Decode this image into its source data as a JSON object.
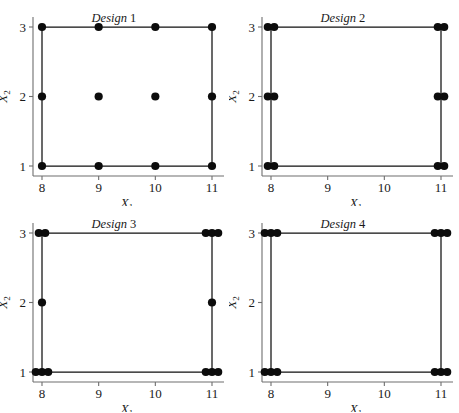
{
  "figure": {
    "panel_order": [
      "design1",
      "design2",
      "design3",
      "design4"
    ]
  },
  "axes": {
    "x_label_main": "X",
    "x_label_sub": "1",
    "y_label_main": "X",
    "y_label_sub": "2",
    "x_ticks": [
      "8",
      "9",
      "10",
      "11"
    ],
    "y_ticks": [
      "1",
      "2",
      "3"
    ],
    "x_tick_values": [
      8,
      9,
      10,
      11
    ],
    "y_tick_values": [
      1,
      2,
      3
    ],
    "xlim": [
      8,
      11
    ],
    "ylim": [
      1,
      3
    ],
    "grid": false
  },
  "style": {
    "marker_color": "#0c0c0c",
    "line_color": "#111111",
    "spine_color": "#6e6e6e",
    "background": "#ffffff",
    "marker_radius": 4.1
  },
  "chart_data": [
    {
      "type": "scatter",
      "id": "design1",
      "title_italic": "Design",
      "title_number": "1",
      "xlabel": "X1",
      "ylabel": "X2",
      "xlim": [
        8,
        11
      ],
      "ylim": [
        1,
        3
      ],
      "grid": false,
      "connecting_rect": [
        [
          8,
          1
        ],
        [
          11,
          1
        ],
        [
          11,
          3
        ],
        [
          8,
          3
        ]
      ],
      "points": [
        {
          "x": 8,
          "y": 3,
          "n": 1
        },
        {
          "x": 9,
          "y": 3,
          "n": 1
        },
        {
          "x": 10,
          "y": 3,
          "n": 1
        },
        {
          "x": 11,
          "y": 3,
          "n": 1
        },
        {
          "x": 8,
          "y": 2,
          "n": 1
        },
        {
          "x": 9,
          "y": 2,
          "n": 1
        },
        {
          "x": 10,
          "y": 2,
          "n": 1
        },
        {
          "x": 11,
          "y": 2,
          "n": 1
        },
        {
          "x": 8,
          "y": 1,
          "n": 1
        },
        {
          "x": 9,
          "y": 1,
          "n": 1
        },
        {
          "x": 10,
          "y": 1,
          "n": 1
        },
        {
          "x": 11,
          "y": 1,
          "n": 1
        }
      ]
    },
    {
      "type": "scatter",
      "id": "design2",
      "title_italic": "Design",
      "title_number": "2",
      "xlabel": "X1",
      "ylabel": "X2",
      "xlim": [
        8,
        11
      ],
      "ylim": [
        1,
        3
      ],
      "grid": false,
      "connecting_rect": [
        [
          8,
          1
        ],
        [
          11,
          1
        ],
        [
          11,
          3
        ],
        [
          8,
          3
        ]
      ],
      "points": [
        {
          "x": 8,
          "y": 3,
          "n": 2
        },
        {
          "x": 11,
          "y": 3,
          "n": 2
        },
        {
          "x": 8,
          "y": 2,
          "n": 2
        },
        {
          "x": 11,
          "y": 2,
          "n": 2
        },
        {
          "x": 8,
          "y": 1,
          "n": 2
        },
        {
          "x": 11,
          "y": 1,
          "n": 2
        }
      ]
    },
    {
      "type": "scatter",
      "id": "design3",
      "title_italic": "Design",
      "title_number": "3",
      "xlabel": "X1",
      "ylabel": "X2",
      "xlim": [
        8,
        11
      ],
      "ylim": [
        1,
        3
      ],
      "grid": false,
      "connecting_rect": [
        [
          8,
          1
        ],
        [
          11,
          1
        ],
        [
          11,
          3
        ],
        [
          8,
          3
        ]
      ],
      "points": [
        {
          "x": 8,
          "y": 3,
          "n": 2
        },
        {
          "x": 11,
          "y": 3,
          "n": 3
        },
        {
          "x": 8,
          "y": 2,
          "n": 1
        },
        {
          "x": 11,
          "y": 2,
          "n": 1
        },
        {
          "x": 8,
          "y": 1,
          "n": 3
        },
        {
          "x": 11,
          "y": 1,
          "n": 3
        }
      ]
    },
    {
      "type": "scatter",
      "id": "design4",
      "title_italic": "Design",
      "title_number": "4",
      "xlabel": "X1",
      "ylabel": "X2",
      "xlim": [
        8,
        11
      ],
      "ylim": [
        1,
        3
      ],
      "grid": false,
      "connecting_rect": [
        [
          8,
          1
        ],
        [
          11,
          1
        ],
        [
          11,
          3
        ],
        [
          8,
          3
        ]
      ],
      "points": [
        {
          "x": 8,
          "y": 3,
          "n": 3
        },
        {
          "x": 11,
          "y": 3,
          "n": 3
        },
        {
          "x": 8,
          "y": 1,
          "n": 3
        },
        {
          "x": 11,
          "y": 1,
          "n": 3
        }
      ]
    }
  ]
}
